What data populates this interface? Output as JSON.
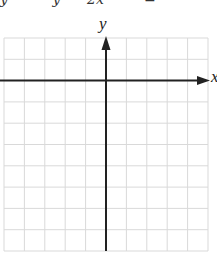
{
  "header": {
    "clipped_equation_fragment": "y          y      2x         ="
  },
  "graph": {
    "type": "coordinate-grid",
    "x_axis_label": "x",
    "y_axis_label": "y",
    "grid": {
      "columns": 10,
      "rows": 10,
      "left": 4,
      "top": 38,
      "right": 208,
      "bottom": 251,
      "line_color": "#d9d9d9"
    },
    "axes": {
      "x_axis_row_index": 2,
      "y_axis_col_index": 5,
      "color": "#222222"
    }
  }
}
